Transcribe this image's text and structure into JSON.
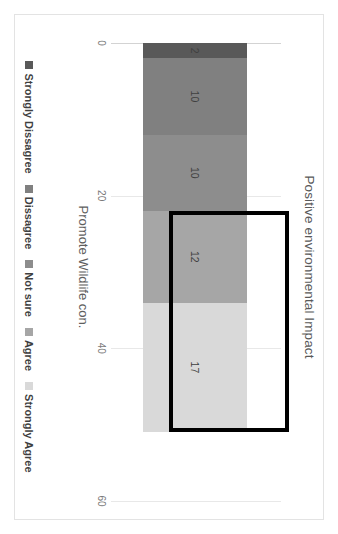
{
  "chart_data": {
    "type": "bar",
    "orientation": "horizontal-stacked",
    "title": "Positive environmental Impact",
    "xlabel": "",
    "ylabel": "",
    "categories": [
      "Promote Wildlife con."
    ],
    "series": [
      {
        "name": "Strongly Dissagree",
        "values": [
          2
        ],
        "color": "#595959"
      },
      {
        "name": "Dissagree",
        "values": [
          10
        ],
        "color": "#808080"
      },
      {
        "name": "Not sure",
        "values": [
          10
        ],
        "color": "#8d8d8d"
      },
      {
        "name": "Agree",
        "values": [
          12
        ],
        "color": "#a6a6a6"
      },
      {
        "name": "Strongly Agree",
        "values": [
          17
        ],
        "color": "#d9d9d9"
      }
    ],
    "data_labels": [
      "2",
      "10",
      "10",
      "12",
      "17"
    ],
    "xlim": [
      0,
      60
    ],
    "xticks": [
      0,
      20,
      40,
      60
    ],
    "xtick_labels": [
      "0",
      "20",
      "40",
      "60"
    ],
    "grid": true,
    "legend_position": "bottom",
    "annotations": [
      {
        "type": "highlight-rectangle",
        "style": "thick black outline",
        "covers": [
          "Agree",
          "Strongly Agree"
        ],
        "start_value": 22,
        "end_value": 51,
        "color": "#000000"
      }
    ],
    "total": 51
  },
  "axis": {
    "ticks": [
      "0",
      "20",
      "40",
      "60"
    ]
  },
  "category": {
    "label": "Promote Wildlife con."
  },
  "legend": {
    "items": [
      {
        "label": "Strongly Dissagree",
        "color": "#595959"
      },
      {
        "label": "Dissagree",
        "color": "#808080"
      },
      {
        "label": "Not sure",
        "color": "#8d8d8d"
      },
      {
        "label": "Agree",
        "color": "#a6a6a6"
      },
      {
        "label": "Strongly Agree",
        "color": "#d9d9d9"
      }
    ]
  },
  "colors": {
    "grid": "#e8e8e8",
    "axis": "#d3d3d3",
    "title_text": "#595959",
    "label_text": "#404040",
    "highlight": "#000000",
    "card_border": "#e3e3e3",
    "background": "#ffffff"
  }
}
